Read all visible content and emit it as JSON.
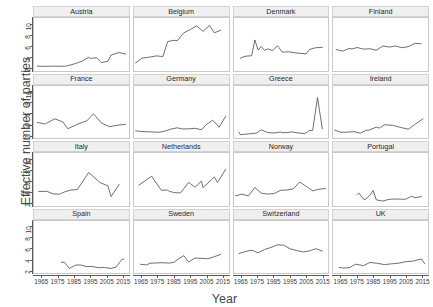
{
  "chart_data": {
    "type": "line",
    "title": "",
    "xlabel": "Year",
    "ylabel": "Effective number of parties",
    "xlim": [
      1960,
      2019
    ],
    "ylim": [
      1.4,
      11.2
    ],
    "xticks": [
      1965,
      1975,
      1985,
      1995,
      2005,
      2015
    ],
    "yticks": [
      2,
      4,
      6,
      8,
      10
    ],
    "grid": false,
    "legend": "none",
    "layout": {
      "rows": 4,
      "cols": 4,
      "facet_strip_position": "top"
    },
    "line_color": "#555555",
    "strip_color": "#efefef",
    "panels": [
      {
        "name": "Austria",
        "x": [
          1962,
          1966,
          1970,
          1971,
          1975,
          1979,
          1983,
          1986,
          1990,
          1994,
          1995,
          1999,
          2002,
          2006,
          2008,
          2013,
          2017
        ],
        "y": [
          2.22,
          2.18,
          2.19,
          2.21,
          2.2,
          2.18,
          2.45,
          2.73,
          3.16,
          3.87,
          3.67,
          3.76,
          2.88,
          3.12,
          4.29,
          4.76,
          4.47
        ]
      },
      {
        "name": "Belgium",
        "x": [
          1961,
          1965,
          1968,
          1971,
          1974,
          1977,
          1978,
          1981,
          1985,
          1987,
          1991,
          1995,
          1999,
          2003,
          2007,
          2010,
          2014
        ],
        "y": [
          2.83,
          3.71,
          3.83,
          3.96,
          4.13,
          4.03,
          4.01,
          6.81,
          7.03,
          6.96,
          8.42,
          9.05,
          9.73,
          8.71,
          9.81,
          8.43,
          8.91
        ]
      },
      {
        "name": "Denmark",
        "x": [
          1964,
          1966,
          1968,
          1971,
          1973,
          1975,
          1977,
          1979,
          1981,
          1984,
          1987,
          1988,
          1990,
          1994,
          1998,
          2001,
          2005,
          2007,
          2011,
          2015
        ],
        "y": [
          3.69,
          3.96,
          4.1,
          4.15,
          7.1,
          5.23,
          5.87,
          5.16,
          5.45,
          5.1,
          6.02,
          5.68,
          4.83,
          4.89,
          4.71,
          4.6,
          4.51,
          5.33,
          5.66,
          5.71
        ]
      },
      {
        "name": "Finland",
        "x": [
          1962,
          1966,
          1970,
          1972,
          1975,
          1979,
          1983,
          1987,
          1991,
          1995,
          1999,
          2003,
          2007,
          2011,
          2015
        ],
        "y": [
          5.31,
          5.02,
          5.5,
          5.44,
          5.69,
          5.39,
          5.46,
          5.17,
          5.98,
          5.78,
          5.97,
          5.65,
          5.86,
          6.47,
          6.4
        ]
      },
      {
        "name": "France",
        "x": [
          1962,
          1967,
          1968,
          1973,
          1978,
          1981,
          1986,
          1988,
          1993,
          1997,
          2002,
          2007,
          2012,
          2017
        ],
        "y": [
          4.4,
          4.1,
          4.27,
          5.07,
          4.48,
          3.23,
          3.91,
          4.18,
          4.71,
          6.03,
          4.29,
          3.6,
          3.88,
          4.04
        ]
      },
      {
        "name": "Germany",
        "x": [
          1961,
          1965,
          1969,
          1972,
          1976,
          1980,
          1983,
          1987,
          1990,
          1994,
          1998,
          2002,
          2005,
          2009,
          2013,
          2017
        ],
        "y": [
          2.83,
          2.69,
          2.66,
          2.6,
          2.58,
          2.85,
          3.16,
          3.4,
          3.18,
          3.2,
          3.31,
          3.03,
          3.99,
          4.83,
          3.51,
          5.52
        ]
      },
      {
        "name": "Greece",
        "x": [
          1963,
          1964,
          1974,
          1977,
          1981,
          1985,
          1989,
          1990,
          1993,
          1996,
          2000,
          2004,
          2007,
          2009,
          2012,
          2015
        ],
        "y": [
          2.61,
          2.1,
          2.41,
          3.03,
          2.5,
          2.43,
          2.61,
          2.49,
          2.51,
          2.63,
          2.44,
          2.3,
          2.9,
          2.92,
          9.05,
          3.22
        ]
      },
      {
        "name": "Ireland",
        "x": [
          1961,
          1965,
          1969,
          1973,
          1977,
          1981,
          1982,
          1987,
          1989,
          1992,
          1997,
          2002,
          2007,
          2011,
          2016
        ],
        "y": [
          2.98,
          2.56,
          2.59,
          2.68,
          2.4,
          2.97,
          2.93,
          3.52,
          3.35,
          3.96,
          3.88,
          3.47,
          3.13,
          4.04,
          5.06
        ]
      },
      {
        "name": "Italy",
        "x": [
          1963,
          1968,
          1972,
          1976,
          1979,
          1983,
          1987,
          1992,
          1994,
          1996,
          2001,
          2006,
          2008,
          2013
        ],
        "y": [
          4.02,
          4.05,
          3.56,
          3.52,
          3.94,
          4.29,
          4.39,
          6.62,
          7.52,
          7.04,
          5.7,
          5.06,
          3.07,
          5.33
        ]
      },
      {
        "name": "Netherlands",
        "x": [
          1963,
          1967,
          1971,
          1972,
          1977,
          1981,
          1982,
          1986,
          1989,
          1994,
          1998,
          2002,
          2003,
          2006,
          2010,
          2012,
          2017
        ],
        "y": [
          5.21,
          6.03,
          6.87,
          6.42,
          4.24,
          4.29,
          4.03,
          3.77,
          3.76,
          5.72,
          4.81,
          5.95,
          4.75,
          5.56,
          6.74,
          5.7,
          8.12
        ]
      },
      {
        "name": "Norway",
        "x": [
          1961,
          1965,
          1969,
          1973,
          1977,
          1981,
          1985,
          1989,
          1993,
          1997,
          2001,
          2005,
          2009,
          2013,
          2017
        ],
        "y": [
          3.21,
          3.52,
          3.2,
          4.78,
          3.68,
          3.54,
          3.62,
          4.24,
          4.29,
          4.53,
          5.79,
          4.95,
          4.14,
          4.44,
          4.56
        ]
      },
      {
        "name": "Portugal",
        "x": [
          1975,
          1976,
          1979,
          1980,
          1983,
          1985,
          1987,
          1991,
          1995,
          1999,
          2002,
          2005,
          2009,
          2011,
          2015
        ],
        "y": [
          3.43,
          3.75,
          2.58,
          2.5,
          3.32,
          4.2,
          2.44,
          2.23,
          2.56,
          2.61,
          2.58,
          2.55,
          3.13,
          2.87,
          3.07
        ]
      },
      {
        "name": "Spain",
        "x": [
          1977,
          1979,
          1982,
          1986,
          1989,
          1993,
          1996,
          2000,
          2004,
          2008,
          2011,
          2015,
          2016
        ],
        "y": [
          3.53,
          3.48,
          2.34,
          2.98,
          3.0,
          2.67,
          2.73,
          2.49,
          2.53,
          2.34,
          2.6,
          4.1,
          4.06
        ]
      },
      {
        "name": "Sweden",
        "x": [
          1964,
          1968,
          1970,
          1973,
          1976,
          1979,
          1982,
          1985,
          1988,
          1991,
          1994,
          1998,
          2002,
          2006,
          2010,
          2014
        ],
        "y": [
          3.12,
          3.0,
          3.34,
          3.35,
          3.41,
          3.4,
          3.34,
          3.51,
          4.2,
          4.73,
          3.54,
          4.29,
          4.23,
          4.15,
          4.54,
          4.96
        ]
      },
      {
        "name": "Switzerland",
        "x": [
          1963,
          1967,
          1971,
          1975,
          1979,
          1983,
          1987,
          1991,
          1995,
          1999,
          2003,
          2007,
          2011,
          2015
        ],
        "y": [
          5.12,
          5.5,
          5.76,
          5.26,
          5.88,
          6.26,
          6.76,
          6.67,
          6.0,
          5.69,
          5.42,
          5.62,
          6.03,
          5.58
        ]
      },
      {
        "name": "UK",
        "x": [
          1964,
          1966,
          1970,
          1974,
          1979,
          1983,
          1987,
          1992,
          1997,
          2001,
          2005,
          2010,
          2015,
          2017
        ],
        "y": [
          2.53,
          2.43,
          2.46,
          3.13,
          2.87,
          3.46,
          3.33,
          3.06,
          3.22,
          3.33,
          3.59,
          3.72,
          4.14,
          3.26
        ]
      }
    ]
  }
}
